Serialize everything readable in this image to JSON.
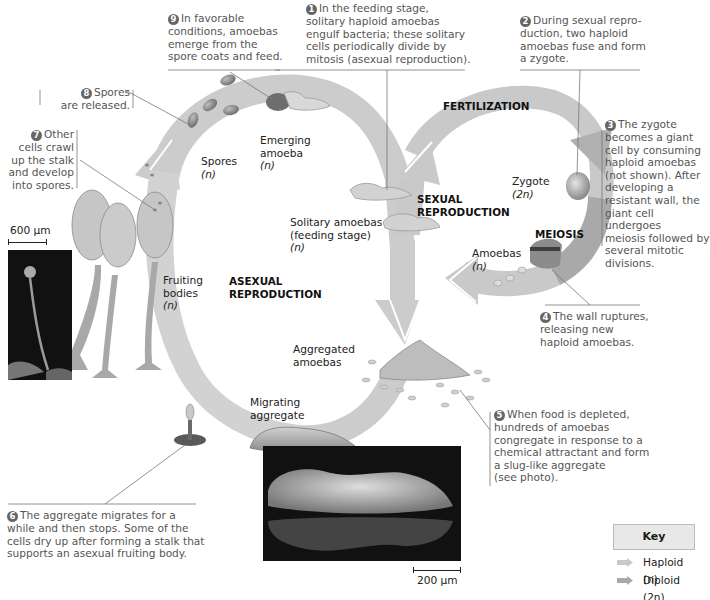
{
  "figure": {
    "steps": [
      {
        "num": "1",
        "text": "In the feeding stage, solitary haploid amoebas engulf bacteria; these solitary cells periodically divide by mitosis (asexual reproduction).",
        "lines": [
          "In the feeding stage,",
          "solitary haploid amoebas",
          "engulf bacteria; these solitary",
          "cells periodically divide by",
          "mitosis (asexual reproduction)."
        ]
      },
      {
        "num": "2",
        "text": "During sexual reproduction, two haploid amoebas fuse and form a zygote.",
        "lines": [
          "During sexual repro-",
          "duction, two haploid",
          "amoebas fuse and form",
          "a zygote."
        ]
      },
      {
        "num": "3",
        "text": "The zygote becomes a giant cell by consuming haploid amoebas (not shown). After developing a resistant wall, the giant cell undergoes meiosis followed by several mitotic divisions.",
        "lines": [
          "The zygote",
          "becomes a giant",
          "cell by consuming",
          "haploid amoebas",
          "(not shown). After",
          "developing a",
          "resistant wall, the",
          "giant cell undergoes",
          "meiosis followed by",
          "several mitotic",
          "divisions."
        ]
      },
      {
        "num": "4",
        "text": "The wall ruptures, releasing new haploid amoebas.",
        "lines": [
          "The wall ruptures,",
          "releasing new",
          "haploid amoebas."
        ]
      },
      {
        "num": "5",
        "text": "When food is depleted, hundreds of amoebas congregate in response to a chemical attractant and form a slug-like aggregate (see photo).",
        "lines": [
          "When food is depleted,",
          "hundreds of amoebas",
          "congregate in response to a",
          "chemical attractant and form",
          "a slug-like aggregate",
          "(see photo)."
        ]
      },
      {
        "num": "6",
        "text": "The aggregate migrates for a while and then stops. Some of the cells dry up after forming a stalk that supports an asexual fruiting body.",
        "lines": [
          "The aggregate migrates for a",
          "while and then stops. Some of the",
          "cells dry up after forming a stalk that",
          "supports an asexual fruiting body."
        ]
      },
      {
        "num": "7",
        "text": "Other cells crawl up the stalk and develop into spores.",
        "lines": [
          "Other",
          "cells crawl",
          "up the stalk",
          "and develop",
          "into spores."
        ]
      },
      {
        "num": "8",
        "text": "Spores are released.",
        "lines": [
          "Spores",
          "are released."
        ]
      },
      {
        "num": "9",
        "text": "In favorable conditions, amoebas emerge from the spore coats and feed.",
        "lines": [
          "In favorable",
          "conditions, amoebas",
          "emerge from the",
          "spore coats and feed."
        ]
      }
    ],
    "stage_labels": {
      "emerging_amoeba": [
        "Emerging",
        "amoeba",
        "(n)"
      ],
      "spores": [
        "Spores",
        "(n)"
      ],
      "solitary_amoebas": [
        "Solitary amoebas",
        "(feeding stage)",
        "(n)"
      ],
      "fruiting_bodies": [
        "Fruiting",
        "bodies",
        "(n)"
      ],
      "aggregated_amoebas": [
        "Aggregated",
        "amoebas"
      ],
      "migrating_aggregate": [
        "Migrating",
        "aggregate"
      ],
      "zygote": [
        "Zygote",
        "(2n)"
      ],
      "amoebas": [
        "Amoebas",
        "(n)"
      ]
    },
    "process_labels": {
      "fertilization": "FERTILIZATION",
      "sexual_reproduction": [
        "SEXUAL",
        "REPRODUCTION"
      ],
      "asexual_reproduction": [
        "ASEXUAL",
        "REPRODUCTION"
      ],
      "meiosis": "MEIOSIS"
    },
    "scale_bars": {
      "fruiting_photo": "600 µm",
      "slug_photo": "200 µm"
    },
    "key": {
      "title": "Key",
      "items": [
        {
          "label": "Haploid (n)",
          "color": "#c8c8c8"
        },
        {
          "label": "Diploid (2n)",
          "color": "#a9a9a9"
        }
      ]
    },
    "colors": {
      "haploid_arrow": "#c9c9c9",
      "diploid_arrow": "#aaaaaa",
      "leader_line": "#777777",
      "caption_text": "#555555"
    }
  }
}
